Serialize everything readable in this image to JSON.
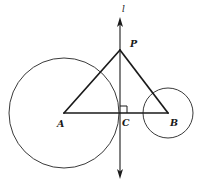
{
  "figure": {
    "type": "geometry-diagram",
    "background_color": "#ffffff",
    "stroke_color": "#1a1a1a",
    "circle_stroke_color": "#3a3a3a",
    "labels": {
      "line_l": "l",
      "point_p": "P",
      "point_a": "A",
      "point_c": "C",
      "point_b": "B"
    },
    "points": {
      "P": {
        "x": 120,
        "y": 50
      },
      "A": {
        "x": 64,
        "y": 113
      },
      "C": {
        "x": 120,
        "y": 113
      },
      "B": {
        "x": 168,
        "y": 113
      }
    },
    "circles": [
      {
        "name": "circle-A",
        "cx": 64,
        "cy": 113,
        "r": 55
      },
      {
        "name": "circle-B",
        "cx": 168,
        "cy": 113,
        "r": 25
      }
    ],
    "line_l_geometry": {
      "x": 120,
      "y_top": 18,
      "y_bottom": 178
    },
    "right_angle_mark": {
      "x": 120,
      "y": 113,
      "size": 7
    },
    "label_positions": {
      "line_l": {
        "left": 122,
        "top": 5
      },
      "point_p": {
        "left": 130,
        "top": 39
      },
      "point_a": {
        "left": 57,
        "top": 119
      },
      "point_c": {
        "left": 122,
        "top": 118
      },
      "point_b": {
        "left": 170,
        "top": 118
      }
    }
  }
}
